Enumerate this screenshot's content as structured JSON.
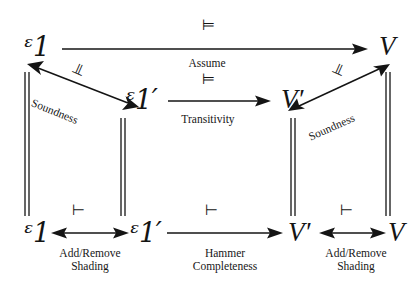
{
  "diagram": {
    "nodes": {
      "top_left": "ᵋ1",
      "top_right": "V",
      "mid_left": "ᵋ1′",
      "mid_right": "V′",
      "bottom_left": "ᵋ1",
      "bottom_left2": "ᵋ1′",
      "bottom_right1": "V′",
      "bottom_right2": "V"
    },
    "symbols": {
      "double_turnstile": "⊨",
      "single_turnstile": "⊢"
    },
    "edges": [
      {
        "id": "top-assume",
        "relation": "⊨",
        "label": "Assume",
        "from": "ᵋ1",
        "to": "V",
        "arrow": "single"
      },
      {
        "id": "left-soundness",
        "relation": "⊨",
        "label": "Soundness",
        "from": "ᵋ1",
        "to": "ᵋ1′",
        "arrow": "double"
      },
      {
        "id": "mid-transitivity",
        "relation": "⊨",
        "label": "Transitivity",
        "from": "ᵋ1′",
        "to": "V′",
        "arrow": "single"
      },
      {
        "id": "right-soundness",
        "relation": "⊨",
        "label": "Soundness",
        "from": "V′",
        "to": "V",
        "arrow": "double"
      },
      {
        "id": "bottom-left-shading",
        "relation": "⊢",
        "label": "Add/Remove\nShading",
        "from": "ᵋ1",
        "to": "ᵋ1′",
        "arrow": "double"
      },
      {
        "id": "bottom-hammer",
        "relation": "⊢",
        "label": "Hammer\nCompleteness",
        "from": "ᵋ1′",
        "to": "V′",
        "arrow": "single"
      },
      {
        "id": "bottom-right-shading",
        "relation": "⊢",
        "label": "Add/Remove\nShading",
        "from": "V′",
        "to": "V",
        "arrow": "double"
      }
    ],
    "connectors": [
      {
        "id": "connector-far-left",
        "style": "double-vertical-line"
      },
      {
        "id": "connector-inner-left",
        "style": "double-vertical-line"
      },
      {
        "id": "connector-inner-right",
        "style": "double-vertical-line"
      },
      {
        "id": "connector-far-right",
        "style": "double-vertical-line"
      }
    ],
    "colors": {
      "ink": "#141414",
      "background": "#ffffff"
    }
  }
}
